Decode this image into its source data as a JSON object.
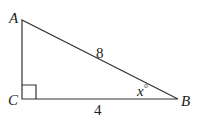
{
  "diagram": {
    "type": "right-triangle",
    "vertices": [
      {
        "name": "A",
        "label": "A"
      },
      {
        "name": "B",
        "label": "B"
      },
      {
        "name": "C",
        "label": "C"
      }
    ],
    "sides": {
      "AB": {
        "label": "8"
      },
      "CB": {
        "label": "4"
      }
    },
    "angle_B": {
      "label": "x°",
      "var": "x",
      "deg": "°"
    },
    "right_angle_at": "C"
  }
}
